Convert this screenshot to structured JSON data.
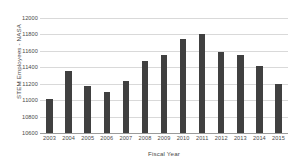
{
  "chart_data": {
    "type": "bar",
    "title": "",
    "xlabel": "Fiscal Year",
    "ylabel": "STEM Employees - NASA",
    "categories": [
      "2003",
      "2004",
      "2005",
      "2006",
      "2007",
      "2008",
      "2009",
      "2010",
      "2011",
      "2012",
      "2013",
      "2014",
      "2015"
    ],
    "values": [
      11010,
      11355,
      11170,
      11100,
      11235,
      11480,
      11545,
      11740,
      11805,
      11585,
      11550,
      11420,
      11200
    ],
    "series": [
      {
        "name": "STEM Employees - NASA",
        "values": [
          11010,
          11355,
          11170,
          11100,
          11235,
          11480,
          11545,
          11740,
          11805,
          11585,
          11550,
          11420,
          11200
        ]
      }
    ],
    "ylim": [
      10600,
      12000
    ],
    "ytick_labels": [
      "10600",
      "10800",
      "11000",
      "11200",
      "11400",
      "11600",
      "11800",
      "12000"
    ],
    "ytick_values": [
      10600,
      10800,
      11000,
      11200,
      11400,
      11600,
      11800,
      12000
    ],
    "grid": true,
    "grid_axis": "y",
    "legend": false,
    "legend_position": "none",
    "bar_color": "#404040",
    "gridline_color": "#d9d9d9",
    "axis_color": "#9b9b9b",
    "background_color": "#ffffff",
    "text_color": "#4a4a4a"
  }
}
